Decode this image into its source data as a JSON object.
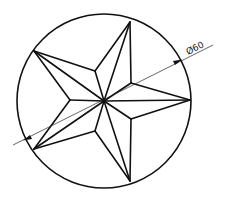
{
  "drawing": {
    "title": "Five-pointed star inscribed in circle",
    "dimension_label": "Ø60",
    "circle": {
      "cx": 104,
      "cy": 101,
      "r": 87
    },
    "star": {
      "center": [
        104,
        101
      ],
      "outer_points": [
        [
          190,
          100
        ],
        [
          130,
          22
        ],
        [
          34,
          51
        ],
        [
          34,
          149
        ],
        [
          130,
          181
        ]
      ],
      "inner_points": [
        [
          131,
          83
        ],
        [
          95,
          71
        ],
        [
          70,
          100
        ],
        [
          95,
          131
        ],
        [
          131,
          119
        ]
      ]
    },
    "leader_line": {
      "x1": 13,
      "y1": 145,
      "x2": 213,
      "y2": 45
    },
    "colors": {
      "line": "#111111",
      "background": "#ffffff"
    }
  }
}
